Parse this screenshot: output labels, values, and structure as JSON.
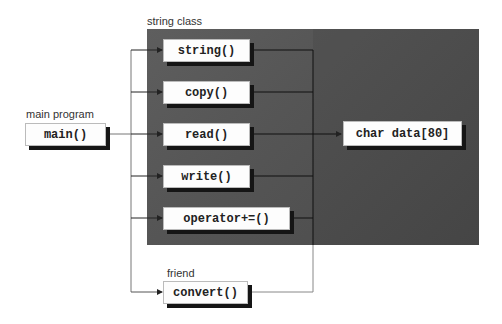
{
  "groups": {
    "string_class": "string class",
    "main_program": "main program",
    "friend": "friend"
  },
  "nodes": {
    "main": "main()",
    "string": "string()",
    "copy": "copy()",
    "read": "read()",
    "write": "write()",
    "operator": "operator+=()",
    "convert": "convert()",
    "char_data": "char data[80]"
  },
  "colors": {
    "panel": "#555555",
    "box": "#fdfdfd",
    "shadow": "#151515",
    "line": "#222222"
  }
}
